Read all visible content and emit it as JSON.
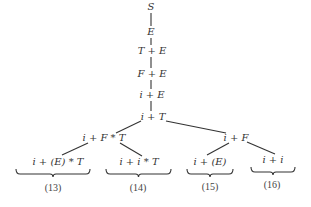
{
  "diagram": {
    "type": "derivation-tree",
    "nodes": [
      {
        "id": "n0",
        "text": "S",
        "x": 151,
        "y": 7
      },
      {
        "id": "n1",
        "text": "E",
        "x": 151,
        "y": 32
      },
      {
        "id": "n2",
        "text": "T + E",
        "x": 152,
        "y": 51
      },
      {
        "id": "n3",
        "text": "F + E",
        "x": 152,
        "y": 74
      },
      {
        "id": "n4",
        "text": "i + E",
        "x": 152,
        "y": 95
      },
      {
        "id": "n5",
        "text": "i + T",
        "x": 153,
        "y": 117
      },
      {
        "id": "n6",
        "text": "i + F * T",
        "x": 104,
        "y": 138
      },
      {
        "id": "n7",
        "text": "i + F",
        "x": 236,
        "y": 138
      },
      {
        "id": "n8",
        "text": "i + (E) * T",
        "x": 58,
        "y": 162
      },
      {
        "id": "n9",
        "text": "i + i * T",
        "x": 139,
        "y": 162
      },
      {
        "id": "n10",
        "text": "i + (E)",
        "x": 210,
        "y": 162
      },
      {
        "id": "n11",
        "text": "i + i",
        "x": 273,
        "y": 160
      }
    ],
    "edges": [
      {
        "x1": 151,
        "y1": 13,
        "x2": 151,
        "y2": 26
      },
      {
        "x1": 151,
        "y1": 38,
        "x2": 151,
        "y2": 45
      },
      {
        "x1": 151,
        "y1": 57,
        "x2": 151,
        "y2": 68
      },
      {
        "x1": 151,
        "y1": 80,
        "x2": 151,
        "y2": 89
      },
      {
        "x1": 151,
        "y1": 101,
        "x2": 151,
        "y2": 111
      },
      {
        "x1": 141,
        "y1": 121,
        "x2": 116,
        "y2": 133
      },
      {
        "x1": 166,
        "y1": 121,
        "x2": 226,
        "y2": 133
      },
      {
        "x1": 88,
        "y1": 143,
        "x2": 62,
        "y2": 155
      },
      {
        "x1": 120,
        "y1": 143,
        "x2": 142,
        "y2": 156
      },
      {
        "x1": 229,
        "y1": 143,
        "x2": 207,
        "y2": 155
      },
      {
        "x1": 247,
        "y1": 142,
        "x2": 275,
        "y2": 154
      }
    ],
    "braces": [
      {
        "x1": 16,
        "x2": 90,
        "y": 169,
        "label": "(13)",
        "label_x": 53,
        "label_y": 188
      },
      {
        "x1": 106,
        "x2": 171,
        "y": 169,
        "label": "(14)",
        "label_x": 138,
        "label_y": 188
      },
      {
        "x1": 187,
        "x2": 233,
        "y": 169,
        "label": "(15)",
        "label_x": 210,
        "label_y": 187
      },
      {
        "x1": 251,
        "x2": 295,
        "y": 167,
        "label": "(16)",
        "label_x": 272,
        "label_y": 185
      }
    ],
    "colors": {
      "ink": "#333333",
      "background": "#ffffff"
    }
  }
}
